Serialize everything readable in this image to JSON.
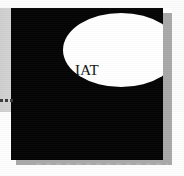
{
  "image": {
    "kind": "scanned-figure",
    "width": 184,
    "height": 176,
    "background_color": "#ffffff",
    "paper_color": "#d2d2d2",
    "paper_lower_color": "#fdfdfd"
  },
  "figure": {
    "label": "black-panel-with-white-ellipse",
    "panel_color": "#050505",
    "shadow_color": "#a9a9a9",
    "panel_x": 11,
    "panel_y": 8,
    "panel_width": 152,
    "panel_height": 152
  },
  "ellipse": {
    "label": "white-ellipse",
    "fill_color": "#ffffff",
    "center_x": 110,
    "center_y": 50,
    "radius_x": 58,
    "radius_y": 37
  },
  "caption": {
    "text": "IAT",
    "color": "#111111",
    "note": "partially occluded serif lettering over the ellipse"
  },
  "margin_marks": {
    "left_ticks_label": "left-margin-tick-marks",
    "left_ticks_count": 3,
    "left_ticks_color": "#3c3c3c",
    "bottom_rule_label": "dashed-baseline-rule",
    "bottom_rule_color": "#b8b8b8"
  }
}
